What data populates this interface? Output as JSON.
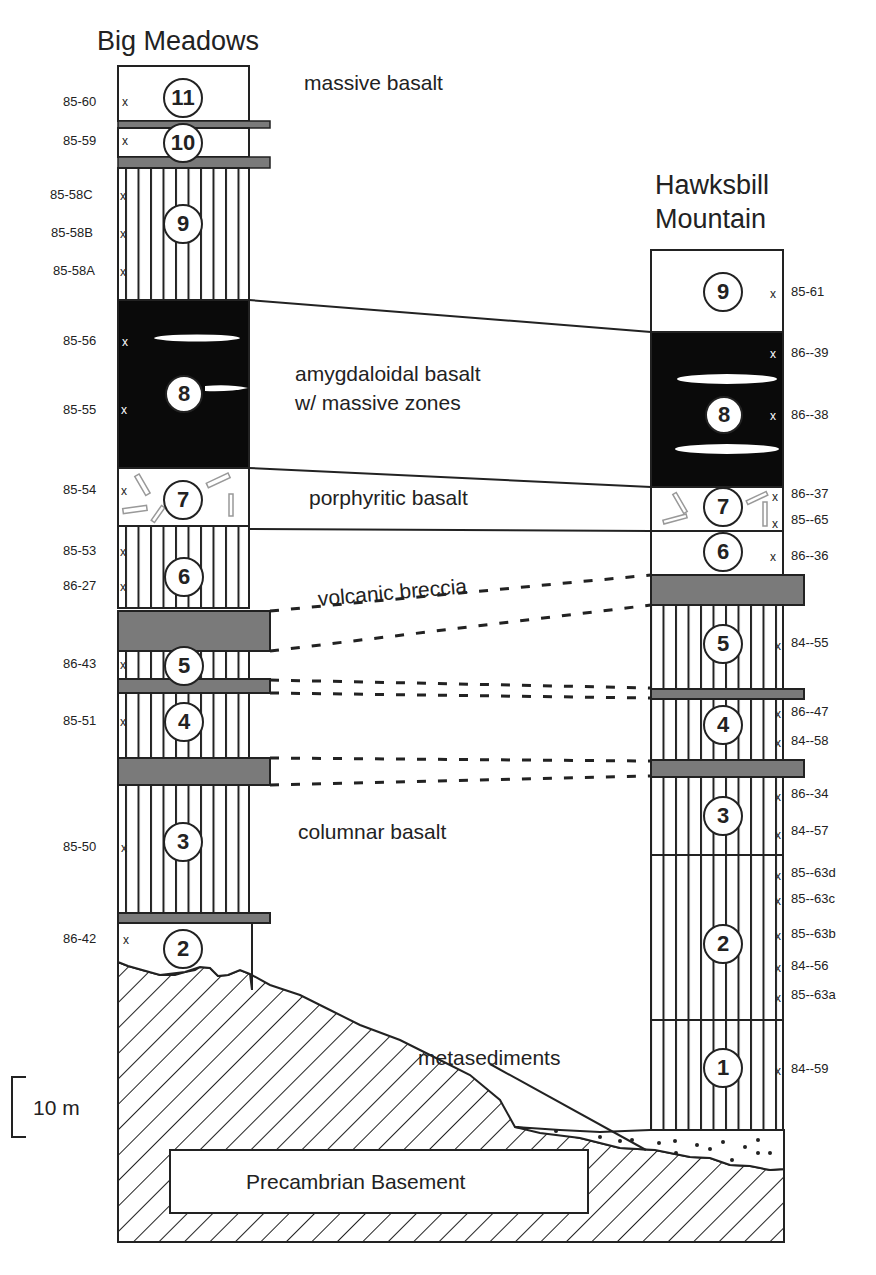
{
  "columns": {
    "big_meadows": {
      "title": "Big Meadows",
      "units": [
        {
          "id": "11",
          "lithology": "massive basalt",
          "samples": [
            "85-60"
          ]
        },
        {
          "id": "10",
          "lithology": "massive basalt",
          "samples": [
            "85-59"
          ]
        },
        {
          "id": "9",
          "lithology": "columnar basalt",
          "samples": [
            "85-58C",
            "85-58B",
            "85-58A"
          ]
        },
        {
          "id": "8",
          "lithology": "amygdaloidal basalt",
          "samples": [
            "85-56",
            "85-55"
          ]
        },
        {
          "id": "7",
          "lithology": "porphyritic basalt",
          "samples": [
            "85-54"
          ]
        },
        {
          "id": "6",
          "lithology": "columnar basalt",
          "samples": [
            "85-53",
            "86-27"
          ]
        },
        {
          "id": "5",
          "lithology": "columnar basalt",
          "samples": [
            "86-43"
          ]
        },
        {
          "id": "4",
          "lithology": "columnar basalt",
          "samples": [
            "85-51"
          ]
        },
        {
          "id": "3",
          "lithology": "columnar basalt",
          "samples": [
            "85-50"
          ]
        },
        {
          "id": "2",
          "lithology": "massive basalt",
          "samples": [
            "86-42"
          ]
        }
      ]
    },
    "hawksbill": {
      "title_line1": "Hawksbill",
      "title_line2": "Mountain",
      "units": [
        {
          "id": "9",
          "lithology": "massive basalt",
          "samples": [
            "85-61"
          ]
        },
        {
          "id": "8",
          "lithology": "amygdaloidal basalt",
          "samples": [
            "86--39",
            "86--38"
          ]
        },
        {
          "id": "7",
          "lithology": "porphyritic basalt",
          "samples": [
            "86--37",
            "85--65"
          ]
        },
        {
          "id": "6",
          "lithology": "massive basalt",
          "samples": [
            "86--36"
          ]
        },
        {
          "id": "5",
          "lithology": "columnar basalt",
          "samples": [
            "84--55"
          ]
        },
        {
          "id": "4",
          "lithology": "columnar basalt",
          "samples": [
            "86--47",
            "84--58"
          ]
        },
        {
          "id": "3",
          "lithology": "columnar basalt",
          "samples": [
            "86--34",
            "84--57"
          ]
        },
        {
          "id": "2",
          "lithology": "columnar basalt",
          "samples": [
            "85--63d",
            "85--63c",
            "85--63b",
            "84--56",
            "85--63a"
          ]
        },
        {
          "id": "1",
          "lithology": "columnar basalt",
          "samples": [
            "84--59"
          ]
        }
      ]
    }
  },
  "labels": {
    "massive_basalt": "massive basalt",
    "amygdaloidal_line1": "amygdaloidal basalt",
    "amygdaloidal_line2": "w/ massive zones",
    "porphyritic": "porphyritic basalt",
    "volcanic_breccia": "volcanic breccia",
    "columnar": "columnar basalt",
    "metasediments": "metasediments",
    "basement": "Precambrian  Basement"
  },
  "scale_bar": {
    "label": "10 m"
  },
  "sample_marker": "x",
  "colors": {
    "breccia": "#7a7a7a",
    "amygdaloidal": "#0a0a0a",
    "line": "#222222"
  }
}
